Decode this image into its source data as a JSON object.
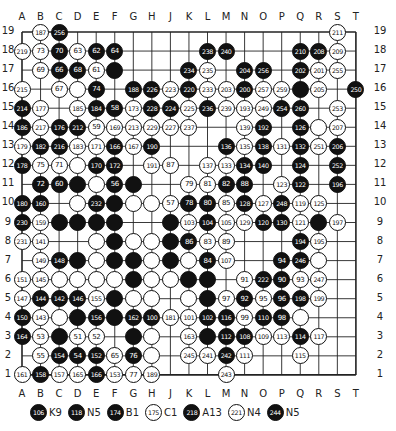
{
  "board": {
    "size": 19,
    "columns": [
      "A",
      "B",
      "C",
      "D",
      "E",
      "F",
      "G",
      "H",
      "J",
      "K",
      "L",
      "M",
      "N",
      "O",
      "P",
      "Q",
      "R",
      "S",
      "T"
    ],
    "rows": [
      19,
      18,
      17,
      16,
      15,
      14,
      13,
      12,
      11,
      10,
      9,
      8,
      7,
      6,
      5,
      4,
      3,
      2,
      1
    ],
    "stones": [
      [
        "B19",
        "w",
        "187"
      ],
      [
        "C19",
        "b",
        "256"
      ],
      [
        "S19",
        "w",
        "211"
      ],
      [
        "A18",
        "w",
        "219"
      ],
      [
        "B18",
        "w",
        "73"
      ],
      [
        "C18",
        "b",
        "70"
      ],
      [
        "D18",
        "w",
        "63"
      ],
      [
        "E18",
        "b",
        "62"
      ],
      [
        "F18",
        "b",
        "64"
      ],
      [
        "L18",
        "b",
        "238"
      ],
      [
        "M18",
        "b",
        "240"
      ],
      [
        "Q18",
        "b",
        "210"
      ],
      [
        "R18",
        "b",
        "208"
      ],
      [
        "S18",
        "w",
        "209"
      ],
      [
        "B17",
        "w",
        "69"
      ],
      [
        "C17",
        "b",
        "66"
      ],
      [
        "D17",
        "b",
        "68"
      ],
      [
        "E17",
        "w",
        "61"
      ],
      [
        "F17",
        "b",
        ""
      ],
      [
        "K17",
        "b",
        "234"
      ],
      [
        "L17",
        "w",
        "235"
      ],
      [
        "N17",
        "b",
        "204"
      ],
      [
        "O17",
        "b",
        "256"
      ],
      [
        "Q17",
        "b",
        "202"
      ],
      [
        "R17",
        "w",
        "201"
      ],
      [
        "S17",
        "w",
        "255"
      ],
      [
        "A16",
        "w",
        "215"
      ],
      [
        "C16",
        "w",
        "67"
      ],
      [
        "D16",
        "w",
        ""
      ],
      [
        "E16",
        "b",
        "74"
      ],
      [
        "G16",
        "b",
        "188"
      ],
      [
        "H16",
        "b",
        "226"
      ],
      [
        "J16",
        "w",
        "223"
      ],
      [
        "K16",
        "b",
        "220"
      ],
      [
        "L16",
        "w",
        "233"
      ],
      [
        "M16",
        "w",
        "203"
      ],
      [
        "N16",
        "b",
        "200"
      ],
      [
        "O16",
        "w",
        "257"
      ],
      [
        "P16",
        "w",
        "259"
      ],
      [
        "Q16",
        "b",
        ""
      ],
      [
        "R16",
        "w",
        "205"
      ],
      [
        "T16",
        "b",
        "250"
      ],
      [
        "A15",
        "b",
        "214"
      ],
      [
        "B15",
        "w",
        "177"
      ],
      [
        "D15",
        "w",
        "185"
      ],
      [
        "E15",
        "b",
        "184"
      ],
      [
        "F15",
        "b",
        "58"
      ],
      [
        "G15",
        "w",
        "173"
      ],
      [
        "H15",
        "b",
        "228"
      ],
      [
        "J15",
        "b",
        "224"
      ],
      [
        "K15",
        "w",
        "225"
      ],
      [
        "L15",
        "b",
        "236"
      ],
      [
        "M15",
        "w",
        "239"
      ],
      [
        "N15",
        "w",
        "193"
      ],
      [
        "O15",
        "w",
        "249"
      ],
      [
        "P15",
        "b",
        "254"
      ],
      [
        "Q15",
        "b",
        "260"
      ],
      [
        "S15",
        "w",
        "253"
      ],
      [
        "A14",
        "b",
        "186"
      ],
      [
        "B14",
        "w",
        "217"
      ],
      [
        "C14",
        "b",
        "176"
      ],
      [
        "D14",
        "b",
        "212"
      ],
      [
        "E14",
        "w",
        "59"
      ],
      [
        "F14",
        "w",
        "169"
      ],
      [
        "G14",
        "w",
        "213"
      ],
      [
        "H14",
        "w",
        "229"
      ],
      [
        "J14",
        "w",
        "227"
      ],
      [
        "K14",
        "w",
        "237"
      ],
      [
        "N14",
        "w",
        "139"
      ],
      [
        "O14",
        "b",
        "192"
      ],
      [
        "Q14",
        "b",
        "126"
      ],
      [
        "R14",
        "w",
        ""
      ],
      [
        "S14",
        "w",
        "207"
      ],
      [
        "A13",
        "w",
        "179"
      ],
      [
        "B13",
        "b",
        "182"
      ],
      [
        "C13",
        "b",
        "216"
      ],
      [
        "D13",
        "w",
        "183"
      ],
      [
        "E13",
        "w",
        "171"
      ],
      [
        "F13",
        "b",
        "166"
      ],
      [
        "G13",
        "w",
        "167"
      ],
      [
        "H13",
        "b",
        "190"
      ],
      [
        "M13",
        "b",
        "136"
      ],
      [
        "N13",
        "w",
        "135"
      ],
      [
        "O13",
        "b",
        "138"
      ],
      [
        "P13",
        "w",
        "131"
      ],
      [
        "Q13",
        "b",
        "132"
      ],
      [
        "R13",
        "w",
        "251"
      ],
      [
        "S13",
        "b",
        "206"
      ],
      [
        "A12",
        "b",
        "178"
      ],
      [
        "B12",
        "w",
        "75"
      ],
      [
        "C12",
        "w",
        "71"
      ],
      [
        "D12",
        "w",
        ""
      ],
      [
        "E12",
        "b",
        "170"
      ],
      [
        "F12",
        "b",
        "172"
      ],
      [
        "H12",
        "w",
        "191"
      ],
      [
        "J12",
        "w",
        "87"
      ],
      [
        "L12",
        "w",
        "137"
      ],
      [
        "M12",
        "w",
        "133"
      ],
      [
        "N12",
        "b",
        "134"
      ],
      [
        "O12",
        "b",
        "140"
      ],
      [
        "Q12",
        "b",
        "124"
      ],
      [
        "S12",
        "b",
        "252"
      ],
      [
        "B11",
        "b",
        "72"
      ],
      [
        "C11",
        "b",
        "60"
      ],
      [
        "D11",
        "b",
        ""
      ],
      [
        "E11",
        "w",
        ""
      ],
      [
        "F11",
        "b",
        "56"
      ],
      [
        "G11",
        "b",
        ""
      ],
      [
        "K11",
        "w",
        "79"
      ],
      [
        "L11",
        "w",
        "81"
      ],
      [
        "M11",
        "b",
        "82"
      ],
      [
        "N11",
        "b",
        "88"
      ],
      [
        "P11",
        "w",
        "123"
      ],
      [
        "Q11",
        "b",
        "122"
      ],
      [
        "S11",
        "b",
        "196"
      ],
      [
        "A10",
        "b",
        "180"
      ],
      [
        "B10",
        "b",
        "160"
      ],
      [
        "D10",
        "w",
        ""
      ],
      [
        "E10",
        "b",
        "232"
      ],
      [
        "F10",
        "b",
        ""
      ],
      [
        "G10",
        "w",
        ""
      ],
      [
        "H10",
        "w",
        ""
      ],
      [
        "J10",
        "w",
        "57"
      ],
      [
        "K10",
        "b",
        "78"
      ],
      [
        "L10",
        "b",
        "80"
      ],
      [
        "M10",
        "w",
        "85"
      ],
      [
        "N10",
        "b",
        "128"
      ],
      [
        "O10",
        "w",
        "127"
      ],
      [
        "P10",
        "b",
        "248"
      ],
      [
        "Q10",
        "w",
        "119"
      ],
      [
        "R10",
        "w",
        "125"
      ],
      [
        "A9",
        "b",
        "230"
      ],
      [
        "B9",
        "w",
        "159"
      ],
      [
        "C9",
        "b",
        ""
      ],
      [
        "D9",
        "b",
        ""
      ],
      [
        "E9",
        "b",
        ""
      ],
      [
        "F9",
        "b",
        ""
      ],
      [
        "J9",
        "b",
        ""
      ],
      [
        "K9",
        "w",
        "103"
      ],
      [
        "L9",
        "b",
        "104"
      ],
      [
        "M9",
        "w",
        "105"
      ],
      [
        "N9",
        "w",
        "129"
      ],
      [
        "O9",
        "b",
        "120"
      ],
      [
        "P9",
        "b",
        "130"
      ],
      [
        "Q9",
        "w",
        "121"
      ],
      [
        "R9",
        "b",
        ""
      ],
      [
        "S9",
        "w",
        "197"
      ],
      [
        "A8",
        "w",
        "231"
      ],
      [
        "B8",
        "w",
        "141"
      ],
      [
        "E8",
        "w",
        ""
      ],
      [
        "F8",
        "b",
        ""
      ],
      [
        "G8",
        "w",
        ""
      ],
      [
        "H8",
        "w",
        ""
      ],
      [
        "J8",
        "b",
        ""
      ],
      [
        "K8",
        "b",
        "86"
      ],
      [
        "L8",
        "w",
        "83"
      ],
      [
        "M8",
        "w",
        "89"
      ],
      [
        "Q8",
        "b",
        "194"
      ],
      [
        "R8",
        "w",
        "195"
      ],
      [
        "B7",
        "w",
        "149"
      ],
      [
        "C7",
        "b",
        "148"
      ],
      [
        "D7",
        "b",
        ""
      ],
      [
        "E7",
        "w",
        ""
      ],
      [
        "F7",
        "b",
        ""
      ],
      [
        "G7",
        "b",
        ""
      ],
      [
        "H7",
        "w",
        ""
      ],
      [
        "J7",
        "b",
        ""
      ],
      [
        "K7",
        "w",
        ""
      ],
      [
        "L7",
        "b",
        "84"
      ],
      [
        "M7",
        "w",
        "107"
      ],
      [
        "P7",
        "b",
        "94"
      ],
      [
        "Q7",
        "b",
        "246"
      ],
      [
        "R7",
        "w",
        ""
      ],
      [
        "A6",
        "w",
        "151"
      ],
      [
        "B6",
        "w",
        "145"
      ],
      [
        "C6",
        "w",
        ""
      ],
      [
        "D6",
        "w",
        ""
      ],
      [
        "E6",
        "w",
        ""
      ],
      [
        "F6",
        "w",
        ""
      ],
      [
        "G6",
        "b",
        ""
      ],
      [
        "H6",
        "w",
        ""
      ],
      [
        "J6",
        "w",
        ""
      ],
      [
        "K6",
        "b",
        ""
      ],
      [
        "L6",
        "b",
        ""
      ],
      [
        "N6",
        "w",
        "91"
      ],
      [
        "O6",
        "b",
        "222"
      ],
      [
        "P6",
        "b",
        "90"
      ],
      [
        "Q6",
        "w",
        "93"
      ],
      [
        "R6",
        "w",
        "247"
      ],
      [
        "A5",
        "w",
        "147"
      ],
      [
        "B5",
        "b",
        "144"
      ],
      [
        "C5",
        "b",
        "142"
      ],
      [
        "D5",
        "b",
        "146"
      ],
      [
        "E5",
        "w",
        "155"
      ],
      [
        "F5",
        "b",
        ""
      ],
      [
        "G5",
        "w",
        ""
      ],
      [
        "H5",
        "w",
        ""
      ],
      [
        "K5",
        "w",
        ""
      ],
      [
        "L5",
        "b",
        ""
      ],
      [
        "M5",
        "w",
        "97"
      ],
      [
        "N5",
        "b",
        "92"
      ],
      [
        "O5",
        "w",
        "95"
      ],
      [
        "P5",
        "b",
        "96"
      ],
      [
        "Q5",
        "b",
        "198"
      ],
      [
        "R5",
        "w",
        "199"
      ],
      [
        "A4",
        "b",
        "150"
      ],
      [
        "B4",
        "w",
        "143"
      ],
      [
        "C4",
        "w",
        ""
      ],
      [
        "D4",
        "b",
        ""
      ],
      [
        "E4",
        "b",
        "156"
      ],
      [
        "F4",
        "b",
        ""
      ],
      [
        "G4",
        "b",
        "162"
      ],
      [
        "H4",
        "b",
        "100"
      ],
      [
        "J4",
        "w",
        "181"
      ],
      [
        "K4",
        "w",
        "101"
      ],
      [
        "L4",
        "b",
        "102"
      ],
      [
        "M4",
        "b",
        "116"
      ],
      [
        "N4",
        "w",
        "99"
      ],
      [
        "O4",
        "b",
        "110"
      ],
      [
        "P4",
        "b",
        "98"
      ],
      [
        "Q4",
        "w",
        ""
      ],
      [
        "A3",
        "b",
        "164"
      ],
      [
        "B3",
        "w",
        "53"
      ],
      [
        "C3",
        "b",
        ""
      ],
      [
        "D3",
        "w",
        "51"
      ],
      [
        "E3",
        "w",
        "52"
      ],
      [
        "G3",
        "b",
        ""
      ],
      [
        "H3",
        "w",
        ""
      ],
      [
        "K3",
        "w",
        "163"
      ],
      [
        "L3",
        "b",
        ""
      ],
      [
        "M3",
        "b",
        "112"
      ],
      [
        "N3",
        "b",
        "108"
      ],
      [
        "O3",
        "w",
        "109"
      ],
      [
        "P3",
        "w",
        "113"
      ],
      [
        "Q3",
        "b",
        "114"
      ],
      [
        "R3",
        "w",
        "117"
      ],
      [
        "B2",
        "w",
        "55"
      ],
      [
        "C2",
        "b",
        "154"
      ],
      [
        "D2",
        "b",
        "54"
      ],
      [
        "E2",
        "b",
        "152"
      ],
      [
        "F2",
        "w",
        "65"
      ],
      [
        "G2",
        "b",
        "76"
      ],
      [
        "H2",
        "w",
        ""
      ],
      [
        "K2",
        "w",
        "245"
      ],
      [
        "L2",
        "w",
        "241"
      ],
      [
        "M2",
        "b",
        "242"
      ],
      [
        "N2",
        "w",
        "111"
      ],
      [
        "Q2",
        "w",
        "115"
      ],
      [
        "A1",
        "w",
        "161"
      ],
      [
        "B1",
        "b",
        "158"
      ],
      [
        "C1",
        "w",
        "157"
      ],
      [
        "D1",
        "w",
        "165"
      ],
      [
        "E1",
        "b",
        "166"
      ],
      [
        "F1",
        "w",
        "153"
      ],
      [
        "G1",
        "w",
        "77"
      ],
      [
        "H1",
        "w",
        "189"
      ],
      [
        "M1",
        "w",
        "243"
      ]
    ]
  },
  "legend": [
    {
      "color": "b",
      "num": "106",
      "at": "K9"
    },
    {
      "color": "b",
      "num": "118",
      "at": "N5"
    },
    {
      "color": "b",
      "num": "174",
      "at": "B1"
    },
    {
      "color": "w",
      "num": "175",
      "at": "C1"
    },
    {
      "color": "b",
      "num": "218",
      "at": "A13"
    },
    {
      "color": "w",
      "num": "221",
      "at": "N4"
    },
    {
      "color": "b",
      "num": "244",
      "at": "N5"
    }
  ]
}
